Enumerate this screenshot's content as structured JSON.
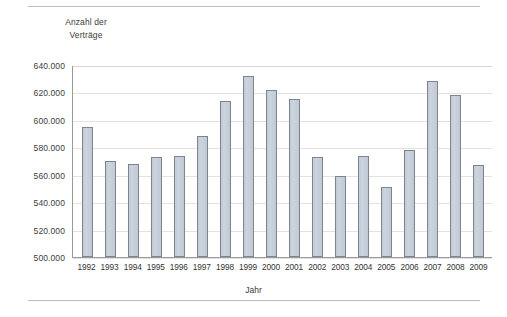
{
  "chart_data": {
    "type": "bar",
    "title": "Anzahl der Verträge",
    "title_lines": [
      "Anzahl der",
      "Verträge"
    ],
    "xlabel": "Jahr",
    "ylabel": "Anzahl der Verträge",
    "categories": [
      "1992",
      "1993",
      "1994",
      "1995",
      "1996",
      "1997",
      "1998",
      "1999",
      "2000",
      "2001",
      "2002",
      "2003",
      "2004",
      "2005",
      "2006",
      "2007",
      "2008",
      "2009"
    ],
    "values": [
      595000,
      570000,
      568000,
      573000,
      574000,
      588000,
      614000,
      632000,
      622000,
      615000,
      573000,
      559000,
      574000,
      551000,
      578000,
      628000,
      618000,
      567000
    ],
    "ylim": [
      500000,
      640000
    ],
    "ytick_step": 20000,
    "ytick_labels": [
      "640.000",
      "620.000",
      "600.000",
      "580.000",
      "560.000",
      "540.000",
      "520.000",
      "500.000"
    ],
    "ytick_values": [
      640000,
      620000,
      600000,
      580000,
      560000,
      540000,
      520000,
      500000
    ],
    "grid": true,
    "legend": false,
    "bar_color": "#c8d0da",
    "bar_border_color": "#7c848e",
    "grid_color": "#e2e2e2",
    "axis_color": "#9a9a9a",
    "background": "#ffffff"
  }
}
